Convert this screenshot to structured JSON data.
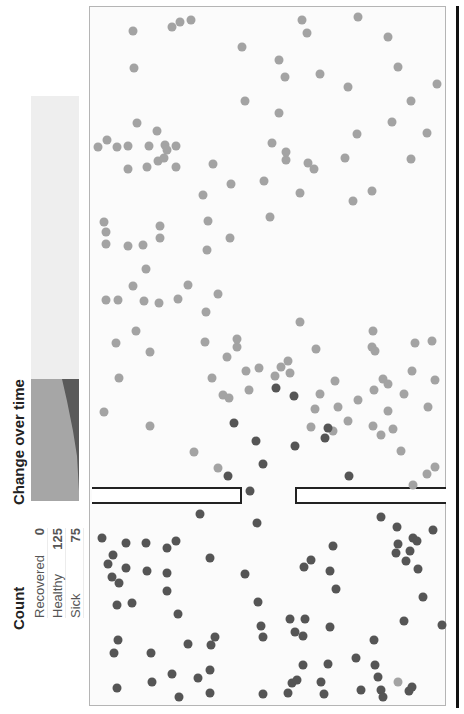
{
  "count": {
    "title": "Count",
    "rows": [
      {
        "label": "Recovered",
        "value": "0"
      },
      {
        "label": "Healthy",
        "value": "125"
      },
      {
        "label": "Sick",
        "value": "75"
      }
    ]
  },
  "change_over_time": {
    "title": "Change over time"
  },
  "colors": {
    "healthy": "#a3a3a3",
    "sick": "#555555",
    "recovered": "#dddddd",
    "timeline_bg": "#eeeeee",
    "timeline_healthy": "#a6a6a6",
    "timeline_sick": "#5a5a5a"
  },
  "simulation": {
    "wall_gap": {
      "top": 487,
      "left_end": 242,
      "right_start": 295
    },
    "healthy_dots": [
      [
        133,
        31
      ],
      [
        172,
        27
      ],
      [
        180,
        22
      ],
      [
        191,
        20
      ],
      [
        134,
        68
      ],
      [
        242,
        47
      ],
      [
        245,
        101
      ],
      [
        137,
        123
      ],
      [
        157,
        131
      ],
      [
        165,
        145
      ],
      [
        149,
        146
      ],
      [
        167,
        150
      ],
      [
        176,
        146
      ],
      [
        128,
        146
      ],
      [
        117,
        147
      ],
      [
        98,
        147
      ],
      [
        107,
        140
      ],
      [
        302,
        20
      ],
      [
        358,
        17
      ],
      [
        307,
        33
      ],
      [
        388,
        37
      ],
      [
        279,
        60
      ],
      [
        285,
        77
      ],
      [
        398,
        67
      ],
      [
        320,
        74
      ],
      [
        411,
        101
      ],
      [
        437,
        84
      ],
      [
        348,
        87
      ],
      [
        357,
        134
      ],
      [
        392,
        122
      ],
      [
        427,
        133
      ],
      [
        279,
        113
      ],
      [
        272,
        143
      ],
      [
        286,
        160
      ],
      [
        128,
        169
      ],
      [
        147,
        167
      ],
      [
        158,
        161
      ],
      [
        164,
        158
      ],
      [
        176,
        167
      ],
      [
        213,
        164
      ],
      [
        203,
        195
      ],
      [
        231,
        184
      ],
      [
        264,
        181
      ],
      [
        208,
        221
      ],
      [
        230,
        238
      ],
      [
        270,
        217
      ],
      [
        308,
        163
      ],
      [
        286,
        152
      ],
      [
        314,
        169
      ],
      [
        345,
        158
      ],
      [
        411,
        159
      ],
      [
        372,
        191
      ],
      [
        353,
        201
      ],
      [
        104,
        222
      ],
      [
        106,
        232
      ],
      [
        106,
        244
      ],
      [
        128,
        246
      ],
      [
        143,
        245
      ],
      [
        160,
        238
      ],
      [
        160,
        226
      ],
      [
        133,
        286
      ],
      [
        146,
        269
      ],
      [
        178,
        299
      ],
      [
        159,
        303
      ],
      [
        188,
        285
      ],
      [
        218,
        294
      ],
      [
        206,
        312
      ],
      [
        300,
        322
      ],
      [
        207,
        250
      ],
      [
        300,
        193
      ],
      [
        106,
        300
      ],
      [
        118,
        300
      ],
      [
        144,
        301
      ],
      [
        116,
        343
      ],
      [
        205,
        342
      ],
      [
        237,
        347
      ],
      [
        227,
        357
      ],
      [
        246,
        371
      ],
      [
        281,
        367
      ],
      [
        275,
        376
      ],
      [
        249,
        390
      ],
      [
        212,
        378
      ],
      [
        223,
        395
      ],
      [
        229,
        398
      ],
      [
        237,
        339
      ],
      [
        259,
        368
      ],
      [
        288,
        361
      ],
      [
        290,
        373
      ],
      [
        335,
        381
      ],
      [
        320,
        394
      ],
      [
        315,
        409
      ],
      [
        311,
        427
      ],
      [
        338,
        407
      ],
      [
        333,
        431
      ],
      [
        373,
        331
      ],
      [
        372,
        347
      ],
      [
        316,
        349
      ],
      [
        348,
        421
      ],
      [
        373,
        426
      ],
      [
        393,
        429
      ],
      [
        358,
        400
      ],
      [
        374,
        390
      ],
      [
        383,
        379
      ],
      [
        388,
        384
      ],
      [
        375,
        351
      ],
      [
        404,
        394
      ],
      [
        428,
        407
      ],
      [
        435,
        380
      ],
      [
        432,
        341
      ],
      [
        412,
        371
      ],
      [
        415,
        343
      ],
      [
        381,
        435
      ],
      [
        427,
        474
      ],
      [
        413,
        485
      ],
      [
        435,
        467
      ],
      [
        401,
        451
      ],
      [
        104,
        412
      ],
      [
        119,
        378
      ],
      [
        136,
        331
      ],
      [
        150,
        426
      ],
      [
        194,
        452
      ],
      [
        218,
        468
      ],
      [
        150,
        352
      ],
      [
        388,
        411
      ],
      [
        398,
        682
      ]
    ],
    "sick_dots": [
      [
        234,
        423
      ],
      [
        276,
        388
      ],
      [
        294,
        396
      ],
      [
        263,
        464
      ],
      [
        256,
        441
      ],
      [
        228,
        476
      ],
      [
        295,
        446
      ],
      [
        325,
        438
      ],
      [
        328,
        428
      ],
      [
        349,
        476
      ],
      [
        250,
        491
      ],
      [
        102,
        538
      ],
      [
        126,
        543
      ],
      [
        146,
        543
      ],
      [
        167,
        548
      ],
      [
        176,
        541
      ],
      [
        200,
        514
      ],
      [
        113,
        555
      ],
      [
        112,
        577
      ],
      [
        108,
        564
      ],
      [
        119,
        583
      ],
      [
        126,
        568
      ],
      [
        147,
        571
      ],
      [
        167,
        573
      ],
      [
        167,
        591
      ],
      [
        132,
        603
      ],
      [
        117,
        605
      ],
      [
        178,
        614
      ],
      [
        210,
        558
      ],
      [
        245,
        574
      ],
      [
        257,
        523
      ],
      [
        258,
        602
      ],
      [
        261,
        626
      ],
      [
        263,
        637
      ],
      [
        118,
        640
      ],
      [
        114,
        653
      ],
      [
        151,
        653
      ],
      [
        117,
        688
      ],
      [
        152,
        682
      ],
      [
        172,
        674
      ],
      [
        179,
        697
      ],
      [
        198,
        678
      ],
      [
        210,
        670
      ],
      [
        211,
        645
      ],
      [
        215,
        637
      ],
      [
        188,
        644
      ],
      [
        210,
        693
      ],
      [
        263,
        694
      ],
      [
        288,
        693
      ],
      [
        292,
        683
      ],
      [
        297,
        680
      ],
      [
        303,
        665
      ],
      [
        321,
        682
      ],
      [
        324,
        694
      ],
      [
        328,
        664
      ],
      [
        356,
        658
      ],
      [
        375,
        665
      ],
      [
        378,
        677
      ],
      [
        303,
        636
      ],
      [
        295,
        632
      ],
      [
        305,
        619
      ],
      [
        290,
        619
      ],
      [
        330,
        627
      ],
      [
        333,
        546
      ],
      [
        330,
        571
      ],
      [
        304,
        567
      ],
      [
        311,
        560
      ],
      [
        336,
        589
      ],
      [
        381,
        517
      ],
      [
        397,
        527
      ],
      [
        398,
        544
      ],
      [
        396,
        553
      ],
      [
        410,
        551
      ],
      [
        413,
        538
      ],
      [
        417,
        541
      ],
      [
        406,
        561
      ],
      [
        418,
        569
      ],
      [
        433,
        530
      ],
      [
        423,
        597
      ],
      [
        404,
        621
      ],
      [
        374,
        640
      ],
      [
        361,
        690
      ],
      [
        381,
        690
      ],
      [
        409,
        691
      ],
      [
        442,
        625
      ],
      [
        383,
        697
      ],
      [
        412,
        687
      ]
    ]
  }
}
